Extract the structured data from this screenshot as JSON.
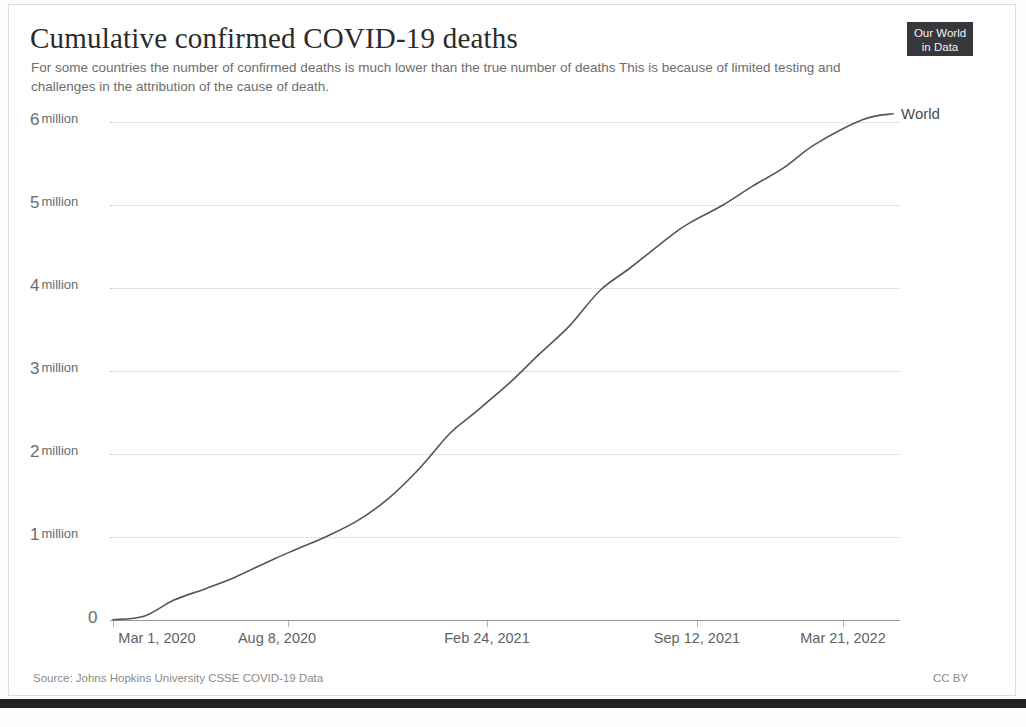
{
  "header": {
    "title": "Cumulative confirmed COVID-19 deaths",
    "subtitle": "For some countries the number of confirmed deaths is much lower than the true number of deaths  This is because of limited testing and challenges in the attribution of the cause of death.",
    "logo_line1": "Our World",
    "logo_line2": "in Data"
  },
  "footer": {
    "source": "Source: Johns Hopkins University CSSE COVID-19 Data",
    "license": "CC BY"
  },
  "axis": {
    "y_ticks": [
      {
        "num": "6",
        "unit": "million"
      },
      {
        "num": "5",
        "unit": "million"
      },
      {
        "num": "4",
        "unit": "million"
      },
      {
        "num": "3",
        "unit": "million"
      },
      {
        "num": "2",
        "unit": "million"
      },
      {
        "num": "1",
        "unit": "million"
      },
      {
        "num": "0",
        "unit": ""
      }
    ],
    "x_ticks": [
      "Mar 1, 2020",
      "Aug 8, 2020",
      "Feb 24, 2021",
      "Sep 12, 2021",
      "Mar 21, 2022"
    ]
  },
  "colors": {
    "line": "#555555",
    "grid": "#c9c9c9",
    "text": "#6b6b6b",
    "logo_bg": "#36383b"
  },
  "chart_data": {
    "type": "line",
    "title": "Cumulative confirmed COVID-19 deaths",
    "subtitle": "For some countries the number of confirmed deaths is much lower than the true number of deaths  This is because of limited testing and challenges in the attribution of the cause of death.",
    "xlabel": "",
    "ylabel": "",
    "xlim": [
      "2020-03-01",
      "2022-04-20"
    ],
    "ylim": [
      0,
      6200000
    ],
    "grid": true,
    "legend_position": "line-end-label",
    "x_tick_labels": [
      "Mar 1, 2020",
      "Aug 8, 2020",
      "Feb 24, 2021",
      "Sep 12, 2021",
      "Mar 21, 2022"
    ],
    "y_tick_labels": [
      "0",
      "1 million",
      "2 million",
      "3 million",
      "4 million",
      "5 million",
      "6 million"
    ],
    "series": [
      {
        "name": "World",
        "x": [
          "2020-03-01",
          "2020-04-01",
          "2020-05-01",
          "2020-06-01",
          "2020-07-01",
          "2020-08-08",
          "2020-09-01",
          "2020-10-01",
          "2020-11-01",
          "2020-12-01",
          "2021-01-01",
          "2021-02-01",
          "2021-02-24",
          "2021-04-01",
          "2021-05-01",
          "2021-06-01",
          "2021-07-01",
          "2021-08-01",
          "2021-09-12",
          "2021-10-01",
          "2021-11-01",
          "2021-12-01",
          "2022-01-01",
          "2022-02-01",
          "2022-03-21",
          "2022-04-20"
        ],
        "values": [
          3000,
          45000,
          240000,
          375000,
          515000,
          730000,
          855000,
          1010000,
          1200000,
          1460000,
          1820000,
          2250000,
          2480000,
          2850000,
          3200000,
          3550000,
          3970000,
          4250000,
          4650000,
          4800000,
          5000000,
          5230000,
          5450000,
          5730000,
          6030000,
          6100000
        ]
      }
    ],
    "annotations": [
      {
        "text": "World",
        "at_x": "2022-04-20",
        "at_y": 6100000
      }
    ]
  }
}
